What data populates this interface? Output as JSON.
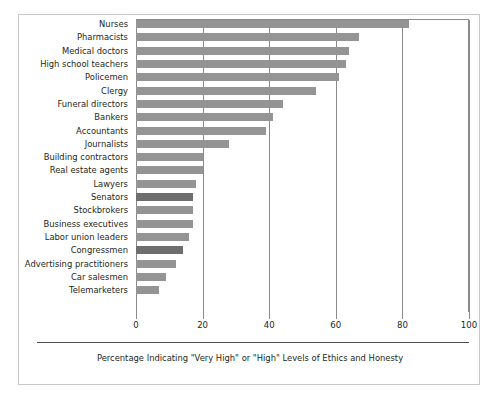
{
  "chart_data": {
    "type": "bar",
    "orientation": "horizontal",
    "title": "",
    "subtitle": "",
    "xlabel": "Percentage Indicating \"Very High\" or \"High\" Levels of Ethics and Honesty",
    "ylabel": "",
    "xlim": [
      0,
      100
    ],
    "xticks": [
      0,
      20,
      40,
      60,
      80,
      100
    ],
    "xtick_labels": [
      "0",
      "20",
      "40",
      "60",
      "80",
      "100"
    ],
    "grid": "vertical-gridlines-at-xticks",
    "legend": "none",
    "bar_color": "#949494",
    "highlight_color": "#6e6e6e",
    "categories": [
      "Nurses",
      "Pharmacists",
      "Medical doctors",
      "High school teachers",
      "Policemen",
      "Clergy",
      "Funeral directors",
      "Bankers",
      "Accountants",
      "Journalists",
      "Building contractors",
      "Real estate agents",
      "Lawyers",
      "Senators",
      "Stockbrokers",
      "Business executives",
      "Labor union leaders",
      "Congressmen",
      "Advertising practitioners",
      "Car salesmen",
      "Telemarketers"
    ],
    "values": [
      82,
      67,
      64,
      63,
      61,
      54,
      44,
      41,
      39,
      28,
      20,
      20,
      18,
      17,
      17,
      17,
      16,
      14,
      12,
      9,
      7
    ],
    "highlighted": [
      "Senators",
      "Congressmen"
    ]
  },
  "caption": {
    "text": "Percentage Indicating \"Very High\" or \"High\" Levels of Ethics and Honesty"
  }
}
